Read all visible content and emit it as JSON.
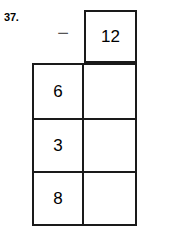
{
  "problem": {
    "number_label": "37.",
    "operator_symbol": "−",
    "operator_name": "minus-sign",
    "subtrahend": "12",
    "ink_color": "#1a1a1a",
    "background_color": "#ffffff",
    "rows": [
      {
        "minuend": "6",
        "answer": ""
      },
      {
        "minuend": "3",
        "answer": ""
      },
      {
        "minuend": "8",
        "answer": ""
      }
    ]
  }
}
